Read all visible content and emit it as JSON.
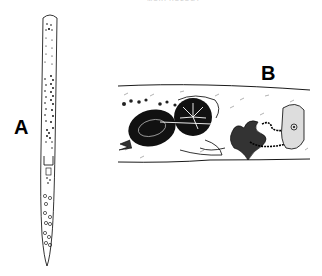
{
  "figure": {
    "top_caption": "MORPHOLOGY",
    "panels": [
      {
        "label": "A",
        "description": "whole worm, elongated body with dotted internal organs"
      },
      {
        "label": "B",
        "description": "body section showing dark oval organs, coiled duct and granular oval cell"
      }
    ],
    "colors": {
      "ink": "#000000",
      "background": "#ffffff",
      "stipple": "#555555"
    }
  }
}
